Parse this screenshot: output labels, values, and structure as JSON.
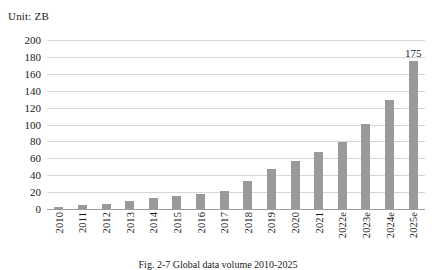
{
  "unit_label": "Unit: ZB",
  "caption": "Fig. 2-7  Global data volume 2010-2025",
  "colors": {
    "bar_fill": "#9a9a9a",
    "gridline": "#d6d6d6",
    "axis": "#9e9e9e",
    "text": "#1a1a1a",
    "background": "#ffffff"
  },
  "chart_data": {
    "type": "bar",
    "title": "",
    "subtitle": "",
    "xlabel": "",
    "ylabel": "Unit: ZB",
    "ylim": [
      0,
      200
    ],
    "ytick_step": 20,
    "yticks": [
      200,
      180,
      160,
      140,
      120,
      100,
      80,
      60,
      40,
      20,
      0
    ],
    "grid": true,
    "legend": false,
    "legend_position": "none",
    "categories": [
      "2010",
      "2011",
      "2012",
      "2013",
      "2014",
      "2015",
      "2016",
      "2017",
      "2018",
      "2019",
      "2020",
      "2021",
      "2022e",
      "2023e",
      "2024e",
      "2025e"
    ],
    "values": [
      2,
      5,
      6.5,
      9,
      12.5,
      15.5,
      18,
      21.5,
      33,
      47,
      57,
      68,
      79,
      101,
      129,
      175
    ],
    "data_labels": {
      "2025e": "175"
    },
    "annotations": [
      {
        "text": "175",
        "category": "2025e",
        "value": 175
      }
    ]
  }
}
